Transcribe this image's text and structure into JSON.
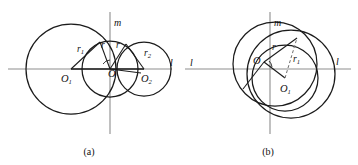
{
  "figure": {
    "title_caption_a": "(a)",
    "title_caption_b": "(b)",
    "background_color": "#ffffff",
    "stroke_color": "#1b1b1b",
    "axis_color": "#8d8d8d"
  },
  "panel_a": {
    "caption": "(a)",
    "labels": {
      "axis_vertical": "m",
      "axis_horizontal": "l",
      "center_left": "O",
      "center_left_sub": "1",
      "center_right": "O",
      "center_right_sub": "2",
      "center_mid": "O",
      "radius_left": "r",
      "radius_left_sub": "1",
      "radius_right": "r",
      "radius_right_sub": "2",
      "radius_mid_left": "r",
      "radius_mid_right": "r"
    }
  },
  "panel_b": {
    "caption": "(b)",
    "labels": {
      "axis_vertical": "m",
      "axis_horizontal_left": "l",
      "axis_horizontal_right": "l",
      "center_main": "O",
      "center_small": "O",
      "center_small_sub": "1",
      "radius_main": "r",
      "radius_small": "r",
      "radius_small_sub": "1"
    }
  }
}
